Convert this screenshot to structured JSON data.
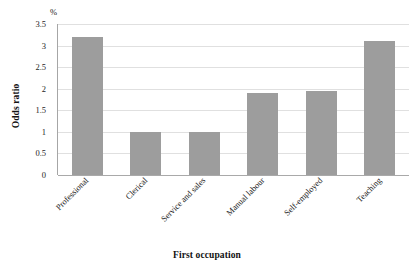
{
  "chart_data": {
    "type": "bar",
    "title": "",
    "subtitle": "",
    "xlabel": "First occupation",
    "ylabel": "Odds ratio",
    "unit_label": "%",
    "categories": [
      "Professional",
      "Clerical",
      "Service and sales",
      "Manual labour",
      "Self-employed",
      "Teaching"
    ],
    "values": [
      3.2,
      1.0,
      1.0,
      1.9,
      1.95,
      3.1
    ],
    "ylim": [
      0,
      3.5
    ],
    "ytick_labels": [
      "3.5",
      "3",
      "2.5",
      "2",
      "1.5",
      "1",
      "0.5",
      "0"
    ],
    "ytick_values": [
      3.5,
      3,
      2.5,
      2,
      1.5,
      1,
      0.5,
      0
    ],
    "grid": "horizontal",
    "legend": "none",
    "bar_color": "#9d9d9d",
    "gridline_color": "#e0e0e0",
    "axis_color": "#a6a6a6",
    "xlabel_rotation": -45
  }
}
